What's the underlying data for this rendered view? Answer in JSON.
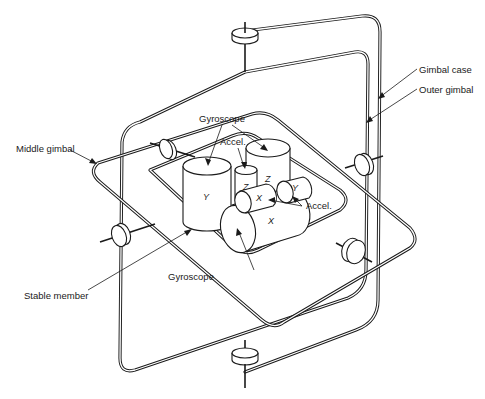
{
  "figure": {
    "labels": {
      "gimbal_case": "Gimbal case",
      "outer_gimbal": "Outer gimbal",
      "middle_gimbal": "Middle gimbal",
      "stable_member": "Stable member",
      "gyroscope_top": "Gyroscope",
      "gyroscope_bottom": "Gyroscope",
      "accel_top": "Accel.",
      "accel_right": "Accel."
    },
    "axis_markers": {
      "gyro_y": "Y",
      "gyro_z": "Z",
      "gyro_x": "X",
      "accel_z": "Z",
      "accel_x": "X",
      "accel_y": "Y"
    },
    "components": [
      {
        "name": "Gimbal case",
        "type": "outer frame"
      },
      {
        "name": "Outer gimbal",
        "type": "ring"
      },
      {
        "name": "Middle gimbal",
        "type": "ring"
      },
      {
        "name": "Stable member",
        "type": "platform"
      },
      {
        "name": "Gyroscope",
        "axes": [
          "X",
          "Y",
          "Z"
        ]
      },
      {
        "name": "Accel.",
        "axes": [
          "X",
          "Y",
          "Z"
        ]
      }
    ],
    "colors": {
      "ink": "#1a1a1a",
      "background": "#ffffff"
    }
  }
}
